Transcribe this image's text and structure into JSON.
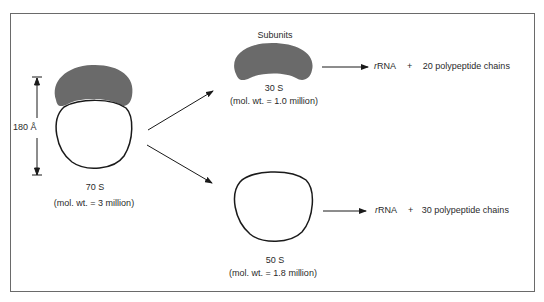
{
  "figure": {
    "ribosome_70s": {
      "label": "70 S",
      "mol_wt": "(mol. wt. = 3 million)",
      "dimension": "180 Å"
    },
    "subunits_heading": "Subunits",
    "subunit_30s": {
      "label": "30 S",
      "mol_wt": "(mol. wt. = 1.0 million)",
      "product_rna_prefix": "r",
      "product_rna": "RNA",
      "plus": "+",
      "product_proteins": "20 polypeptide chains"
    },
    "subunit_50s": {
      "label": "50 S",
      "mol_wt": "(mol. wt. = 1.8 million)",
      "product_rna_prefix": "r",
      "product_rna": "RNA",
      "plus": "+",
      "product_proteins": "30 polypeptide chains"
    },
    "colors": {
      "small_subunit_fill": "#6a6a6a",
      "outline": "#1a1a1a",
      "frame": "#6a6a6a"
    }
  }
}
